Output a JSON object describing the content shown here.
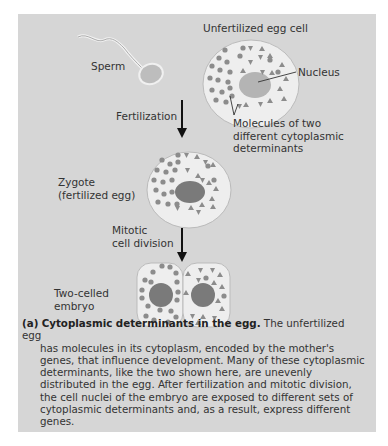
{
  "figure": {
    "labels": {
      "sperm": "Sperm",
      "unfertilized_egg": "Unfertilized egg cell",
      "nucleus": "Nucleus",
      "molecules_line1": "Molecules of two",
      "molecules_line2": "different cytoplasmic",
      "molecules_line3": "determinants",
      "fertilization": "Fertilization",
      "zygote_line1": "Zygote",
      "zygote_line2": "(fertilized egg)",
      "mitotic_line1": "Mitotic",
      "mitotic_line2": "cell division",
      "embryo_line1": "Two-celled",
      "embryo_line2": "embryo"
    },
    "colors": {
      "panel": "#d6d6d6",
      "cell_fill": "#eeeeee",
      "nucleus_fill": "#8a8a8a",
      "determinant": "#8c8c8c"
    }
  },
  "caption": {
    "tag": "(a)",
    "title": "Cytoplasmic determinants in the egg.",
    "first_line_rest": " The unfertilized egg",
    "body": "has molecules in its cytoplasm, encoded by the mother's genes, that influence development. Many of these cytoplasmic determinants, like the two shown here, are unevenly distributed in the egg. After fertilization and mitotic division, the cell nuclei of the embryo are exposed to different sets of cytoplasmic determinants and, as a result, express different genes."
  }
}
